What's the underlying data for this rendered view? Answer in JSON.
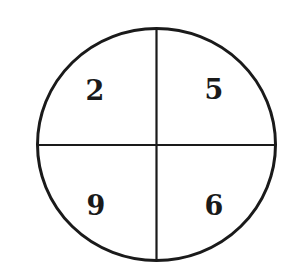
{
  "diagram": {
    "type": "circle-quadrants",
    "stroke_color": "#1a1a1a",
    "background": "#ffffff",
    "quadrants": {
      "top_left": "2",
      "top_right": "5",
      "bottom_left": "9",
      "bottom_right": "6"
    }
  }
}
